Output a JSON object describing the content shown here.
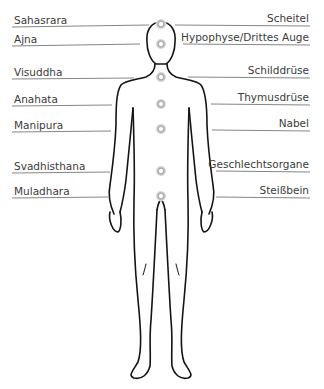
{
  "diagram": {
    "title": "",
    "colors": {
      "text": "#3b3b3b",
      "line": "#555555",
      "outline": "#111111",
      "chakra_glow": "#bdbdbd"
    },
    "left_labels": [
      {
        "text": "Sahasrara",
        "y": 15
      },
      {
        "text": "Ajna",
        "y": 34
      },
      {
        "text": "Visuddha",
        "y": 66
      },
      {
        "text": "Anahata",
        "y": 94
      },
      {
        "text": "Manipura",
        "y": 120
      },
      {
        "text": "Svadhisthana",
        "y": 161
      },
      {
        "text": "Muladhara",
        "y": 186
      }
    ],
    "right_labels": [
      {
        "text": "Scheitel",
        "y": 15
      },
      {
        "text": "Hypophyse/Drittes Auge",
        "y": 34
      },
      {
        "text": "Schilddrüse",
        "y": 66
      },
      {
        "text": "Thymusdrüse",
        "y": 94
      },
      {
        "text": "Nabel",
        "y": 120
      },
      {
        "text": "Geschlechtsorgane",
        "y": 161
      },
      {
        "text": "Steißbein",
        "y": 186
      }
    ],
    "chakras": [
      {
        "name": "Sahasrara",
        "cx": 161,
        "cy": 24
      },
      {
        "name": "Ajna",
        "cx": 161,
        "cy": 44
      },
      {
        "name": "Visuddha",
        "cx": 161,
        "cy": 77
      },
      {
        "name": "Anahata",
        "cx": 161,
        "cy": 104
      },
      {
        "name": "Manipura",
        "cx": 161,
        "cy": 129
      },
      {
        "name": "Svadhisthana",
        "cx": 161,
        "cy": 171
      },
      {
        "name": "Muladhara",
        "cx": 161,
        "cy": 196
      }
    ]
  }
}
